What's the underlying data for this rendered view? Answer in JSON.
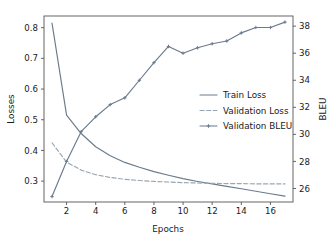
{
  "chart_data": {
    "type": "line",
    "title": "",
    "xlabel": "Epochs",
    "ylabel": "Losses",
    "y2label": "BLEU",
    "grid": false,
    "legend_position": "center-right",
    "xlim": [
      0.45,
      17.55
    ],
    "ylim": [
      0.232,
      0.838
    ],
    "y2lim": [
      25.0,
      38.75
    ],
    "xticks": [
      2,
      4,
      6,
      8,
      10,
      12,
      14,
      16
    ],
    "yticks": [
      0.3,
      0.4,
      0.5,
      0.6,
      0.7,
      0.8
    ],
    "y2ticks": [
      26,
      28,
      30,
      32,
      34,
      36,
      38
    ],
    "x": [
      1,
      2,
      3,
      4,
      5,
      6,
      7,
      8,
      9,
      10,
      11,
      12,
      13,
      14,
      15,
      16,
      17
    ],
    "series": [
      {
        "name": "Train Loss",
        "axis": "left",
        "style": "solid",
        "marker": "none",
        "color": "#6a7b8c",
        "values": [
          0.815,
          0.515,
          0.455,
          0.412,
          0.383,
          0.361,
          0.345,
          0.331,
          0.319,
          0.308,
          0.299,
          0.291,
          0.283,
          0.275,
          0.267,
          0.259,
          0.251
        ]
      },
      {
        "name": "Validation Loss",
        "axis": "left",
        "style": "dashed",
        "marker": "none",
        "color": "#9aa7b2",
        "values": [
          0.425,
          0.362,
          0.336,
          0.321,
          0.312,
          0.306,
          0.302,
          0.299,
          0.297,
          0.295,
          0.294,
          0.293,
          0.292,
          0.292,
          0.291,
          0.291,
          0.291
        ]
      },
      {
        "name": "Validation BLEU",
        "axis": "right",
        "style": "solid",
        "marker": "plus",
        "color": "#6a7b8c",
        "values": [
          25.4,
          28.0,
          30.2,
          31.3,
          32.2,
          32.7,
          34.0,
          35.3,
          36.5,
          36.0,
          36.4,
          36.7,
          36.9,
          37.5,
          37.9,
          37.9,
          38.3
        ]
      }
    ],
    "legend_entries": [
      {
        "label": "Train Loss",
        "style": "solid",
        "marker": "none",
        "color": "#6a7b8c"
      },
      {
        "label": "Validation Loss",
        "style": "dashed",
        "marker": "none",
        "color": "#9aa7b2"
      },
      {
        "label": "Validation BLEU",
        "style": "solid",
        "marker": "plus",
        "color": "#6a7b8c"
      }
    ]
  },
  "axes": {
    "x_tick_labels": [
      "2",
      "4",
      "6",
      "8",
      "10",
      "12",
      "14",
      "16"
    ],
    "y_tick_labels": [
      "0.3",
      "0.4",
      "0.5",
      "0.6",
      "0.7",
      "0.8"
    ],
    "y2_tick_labels": [
      "26",
      "28",
      "30",
      "32",
      "34",
      "36",
      "38"
    ],
    "x_axis_label": "Epochs",
    "y_axis_label": "Losses",
    "y2_axis_label": "BLEU"
  },
  "colors": {
    "train_loss": "#6a7b8c",
    "validation_loss": "#9aa7b2",
    "validation_bleu": "#6a7b8c",
    "spine": "#555555",
    "text": "#1a1a1a",
    "background": "#ffffff"
  }
}
